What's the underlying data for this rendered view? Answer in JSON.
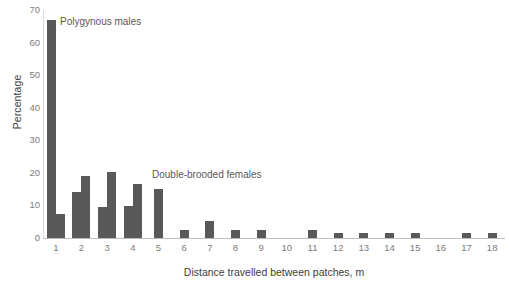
{
  "chart_data": {
    "type": "bar",
    "title": "",
    "xlabel": "Distance travelled between patches, m",
    "ylabel": "Percentage",
    "ylim": [
      0,
      70
    ],
    "yticks": [
      0,
      10,
      20,
      30,
      40,
      50,
      60,
      70
    ],
    "categories": [
      "1",
      "2",
      "3",
      "4",
      "5",
      "6",
      "7",
      "8",
      "9",
      "10",
      "11",
      "12",
      "13",
      "14",
      "15",
      "16",
      "17",
      "18"
    ],
    "grid": false,
    "legend": "annotations-inline",
    "bar_color": "#595959",
    "series": [
      {
        "name": "Polygynous males",
        "values": [
          67.0,
          14.0,
          9.5,
          9.8,
          15.0,
          2.4,
          5.3,
          2.5,
          2.6,
          0,
          2.4,
          1.5,
          1.5,
          1.5,
          1.5,
          0,
          1.4,
          1.4
        ]
      },
      {
        "name": "Double-brooded females",
        "values": [
          7.5,
          19.0,
          20.3,
          16.5,
          0,
          0,
          0,
          0,
          0,
          0,
          0,
          0,
          0,
          0,
          0,
          0,
          0,
          0
        ]
      }
    ],
    "annotations": [
      {
        "id": "ann-males",
        "text": "Polygynous males"
      },
      {
        "id": "ann-females",
        "text": "Double-brooded females"
      }
    ]
  }
}
